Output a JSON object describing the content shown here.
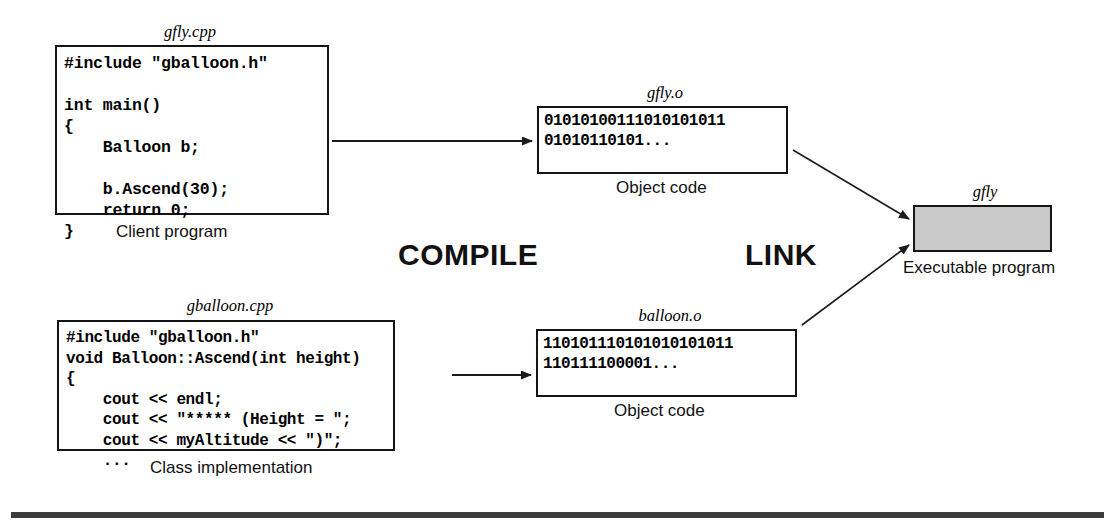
{
  "figure": {
    "colors": {
      "ink": "#151515",
      "executable_fill": "#c9c9c9",
      "rule": "#3c3c3c",
      "background": "#ffffff"
    }
  },
  "source_files": [
    {
      "filename": "gfly.cpp",
      "caption": "Client program",
      "code": "#include \"gballoon.h\"\n\nint main()\n{\n    Balloon b;\n\n    b.Ascend(30);\n    return 0;\n}"
    },
    {
      "filename": "gballoon.cpp",
      "caption": "Class implementation",
      "code": "#include \"gballoon.h\"\nvoid Balloon::Ascend(int height)\n{\n    cout << endl;\n    cout << \"***** (Height = \";\n    cout << myAltitude << \")\";\n    ..."
    }
  ],
  "object_files": [
    {
      "filename": "gfly.o",
      "caption": "Object code",
      "bits": "01010100111010101011\n01010110101..."
    },
    {
      "filename": "balloon.o",
      "caption": "Object code",
      "bits": "110101110101010101011\n110111100001..."
    }
  ],
  "executable": {
    "filename": "gfly",
    "caption": "Executable program"
  },
  "processes": {
    "compile": "COMPILE",
    "link": "LINK"
  },
  "arrows": [
    {
      "name": "compile-arrow-gfly",
      "from": "gfly.cpp",
      "to": "gfly.o"
    },
    {
      "name": "compile-arrow-gballoon",
      "from": "gballoon.cpp",
      "to": "balloon.o"
    },
    {
      "name": "link-arrow-gfly-o",
      "from": "gfly.o",
      "to": "gfly"
    },
    {
      "name": "link-arrow-balloon-o",
      "from": "balloon.o",
      "to": "gfly"
    }
  ]
}
